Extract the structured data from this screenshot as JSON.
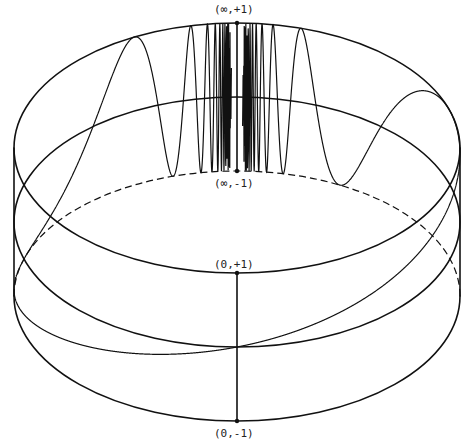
{
  "figure": {
    "labels": {
      "top_back": "(∞,+1)",
      "bottom_back": "(∞,-1)",
      "top_front": "(0,+1)",
      "bottom_front": "(0,-1)"
    },
    "geometry": {
      "cx": 237,
      "rx": 223,
      "ry": 125,
      "top_cy": 148,
      "mid_cy": 222,
      "bot_cy": 296
    },
    "colors": {
      "ink": "#111111",
      "background": "#ffffff"
    }
  }
}
